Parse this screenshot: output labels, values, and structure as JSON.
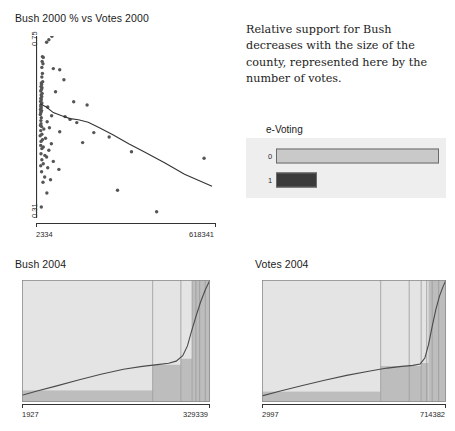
{
  "description": {
    "text": "Relative support for Bush decreases with the size of the county, represented here by the number of votes."
  },
  "colors": {
    "bar_level0": "#c9c9c9",
    "bar_level1": "#3a3a3a",
    "bar_border": "#6a6a6a",
    "plot_background": "#eeeeee",
    "axis": "#333333",
    "point": "#555555",
    "trend_line": "#333333",
    "density_light": "#e4e4e4",
    "density_dark": "#bdbdbd"
  },
  "evoting": {
    "title": "e-Voting",
    "categories": [
      "0",
      "1"
    ],
    "values": [
      100,
      25
    ],
    "bar_colors": [
      "#c9c9c9",
      "#3a3a3a"
    ]
  },
  "chart_data": [
    {
      "id": "scatter",
      "type": "scatter",
      "title": "Bush 2000 % vs Votes 2000",
      "xlabel": "",
      "ylabel": "",
      "xlim": [
        2334,
        618341
      ],
      "ylim": [
        0.31,
        0.75
      ],
      "xtick_labels": [
        "2334",
        "618341"
      ],
      "ytick_labels": [
        "0.75",
        "0.31"
      ],
      "grid": false,
      "legend": "none",
      "points": [
        [
          26000,
          0.742
        ],
        [
          34000,
          0.748
        ],
        [
          45000,
          0.757
        ],
        [
          11000,
          0.706
        ],
        [
          14000,
          0.704
        ],
        [
          10000,
          0.694
        ],
        [
          13000,
          0.688
        ],
        [
          9000,
          0.679
        ],
        [
          50000,
          0.676
        ],
        [
          73000,
          0.673
        ],
        [
          11000,
          0.664
        ],
        [
          9000,
          0.655
        ],
        [
          88000,
          0.648
        ],
        [
          12000,
          0.643
        ],
        [
          7000,
          0.64
        ],
        [
          8000,
          0.636
        ],
        [
          6000,
          0.631
        ],
        [
          9500,
          0.628
        ],
        [
          7500,
          0.624
        ],
        [
          5000,
          0.62
        ],
        [
          58000,
          0.618
        ],
        [
          10000,
          0.614
        ],
        [
          6500,
          0.61
        ],
        [
          8500,
          0.606
        ],
        [
          5500,
          0.602
        ],
        [
          7000,
          0.598
        ],
        [
          4500,
          0.594
        ],
        [
          123000,
          0.593
        ],
        [
          9000,
          0.59
        ],
        [
          6000,
          0.586
        ],
        [
          171000,
          0.585
        ],
        [
          5000,
          0.582
        ],
        [
          30000,
          0.58
        ],
        [
          7000,
          0.578
        ],
        [
          4000,
          0.574
        ],
        [
          8000,
          0.571
        ],
        [
          6000,
          0.568
        ],
        [
          5000,
          0.565
        ],
        [
          3500,
          0.561
        ],
        [
          44000,
          0.558
        ],
        [
          92000,
          0.556
        ],
        [
          7000,
          0.553
        ],
        [
          110000,
          0.549
        ],
        [
          5500,
          0.546
        ],
        [
          28000,
          0.543
        ],
        [
          134000,
          0.541
        ],
        [
          6000,
          0.538
        ],
        [
          4000,
          0.534
        ],
        [
          8000,
          0.531
        ],
        [
          36000,
          0.528
        ],
        [
          16000,
          0.525
        ],
        [
          5000,
          0.521
        ],
        [
          73000,
          0.518
        ],
        [
          195000,
          0.516
        ],
        [
          9000,
          0.512
        ],
        [
          3000,
          0.508
        ],
        [
          250000,
          0.505
        ],
        [
          22000,
          0.502
        ],
        [
          11000,
          0.498
        ],
        [
          6000,
          0.494
        ],
        [
          155000,
          0.491
        ],
        [
          43000,
          0.488
        ],
        [
          5000,
          0.484
        ],
        [
          14000,
          0.48
        ],
        [
          9000,
          0.476
        ],
        [
          34000,
          0.472
        ],
        [
          330000,
          0.468
        ],
        [
          6000,
          0.463
        ],
        [
          20000,
          0.459
        ],
        [
          26000,
          0.455
        ],
        [
          590000,
          0.452
        ],
        [
          9000,
          0.448
        ],
        [
          50000,
          0.444
        ],
        [
          14000,
          0.438
        ],
        [
          5000,
          0.433
        ],
        [
          30000,
          0.428
        ],
        [
          70000,
          0.424
        ],
        [
          8000,
          0.418
        ],
        [
          19000,
          0.405
        ],
        [
          40000,
          0.398
        ],
        [
          13000,
          0.392
        ],
        [
          280000,
          0.372
        ],
        [
          27000,
          0.365
        ],
        [
          7000,
          0.33
        ],
        [
          420000,
          0.318
        ]
      ],
      "trend_line": [
        [
          2334,
          0.588
        ],
        [
          25000,
          0.58
        ],
        [
          50000,
          0.566
        ],
        [
          80000,
          0.558
        ],
        [
          110000,
          0.551
        ],
        [
          140000,
          0.548
        ],
        [
          175000,
          0.542
        ],
        [
          215000,
          0.528
        ],
        [
          265000,
          0.51
        ],
        [
          320000,
          0.488
        ],
        [
          380000,
          0.466
        ],
        [
          450000,
          0.44
        ],
        [
          520000,
          0.412
        ],
        [
          618341,
          0.382
        ]
      ]
    },
    {
      "id": "bush2004",
      "type": "area",
      "title": "Bush 2004",
      "xlim": [
        1927,
        329339
      ],
      "xtick_labels": [
        "1927",
        "329339"
      ],
      "grid": false,
      "legend": "none",
      "curve": [
        [
          0.0,
          0.055
        ],
        [
          0.08,
          0.09
        ],
        [
          0.18,
          0.13
        ],
        [
          0.3,
          0.18
        ],
        [
          0.42,
          0.228
        ],
        [
          0.54,
          0.268
        ],
        [
          0.64,
          0.292
        ],
        [
          0.72,
          0.306
        ],
        [
          0.78,
          0.318
        ],
        [
          0.82,
          0.335
        ],
        [
          0.855,
          0.38
        ],
        [
          0.88,
          0.46
        ],
        [
          0.9,
          0.57
        ],
        [
          0.925,
          0.7
        ],
        [
          0.95,
          0.82
        ],
        [
          0.975,
          0.92
        ],
        [
          1.0,
          1.0
        ]
      ],
      "shaded_bands": [
        {
          "x0": 0.0,
          "x1": 0.695,
          "y": 0.095
        },
        {
          "x0": 0.695,
          "x1": 0.845,
          "y": 0.305
        },
        {
          "x0": 0.845,
          "x1": 0.905,
          "y": 0.355
        },
        {
          "x0": 0.905,
          "x1": 1.0,
          "y": 1.0
        }
      ],
      "vlines": [
        0.695,
        0.845,
        0.905,
        0.925,
        0.945,
        0.975
      ]
    },
    {
      "id": "votes2004",
      "type": "area",
      "title": "Votes 2004",
      "xlim": [
        2997,
        714382
      ],
      "xtick_labels": [
        "2997",
        "714382"
      ],
      "grid": false,
      "legend": "none",
      "curve": [
        [
          0.0,
          0.05
        ],
        [
          0.1,
          0.09
        ],
        [
          0.22,
          0.135
        ],
        [
          0.34,
          0.178
        ],
        [
          0.46,
          0.218
        ],
        [
          0.58,
          0.252
        ],
        [
          0.68,
          0.278
        ],
        [
          0.76,
          0.292
        ],
        [
          0.82,
          0.3
        ],
        [
          0.86,
          0.312
        ],
        [
          0.885,
          0.36
        ],
        [
          0.905,
          0.47
        ],
        [
          0.925,
          0.62
        ],
        [
          0.945,
          0.76
        ],
        [
          0.965,
          0.87
        ],
        [
          0.985,
          0.95
        ],
        [
          1.0,
          1.0
        ]
      ],
      "shaded_bands": [
        {
          "x0": 0.0,
          "x1": 0.645,
          "y": 0.085
        },
        {
          "x0": 0.645,
          "x1": 0.865,
          "y": 0.295
        },
        {
          "x0": 0.865,
          "x1": 0.905,
          "y": 0.32
        },
        {
          "x0": 0.905,
          "x1": 1.0,
          "y": 1.0
        }
      ],
      "vlines": [
        0.645,
        0.8,
        0.865,
        0.895,
        0.925,
        0.96
      ]
    }
  ]
}
